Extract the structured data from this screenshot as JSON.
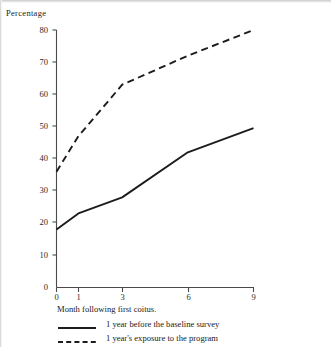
{
  "figure": {
    "y_axis_label": "Percentage",
    "x_axis_caption": "Month following first coitus."
  },
  "legend": {
    "items": [
      {
        "label": "1 year before the baseline survey",
        "style": "solid",
        "swatch_icon": "solid-line-icon"
      },
      {
        "label": "1 year's exposure to the program",
        "style": "dashed",
        "swatch_icon": "dashed-line-icon"
      }
    ]
  },
  "axes": {
    "y_ticks": [
      "80",
      "70",
      "60",
      "50",
      "40",
      "30",
      "20",
      "10",
      "0"
    ],
    "x_ticks": [
      "0",
      "1",
      "3",
      "6",
      "9"
    ]
  },
  "chart_data": {
    "type": "line",
    "title": "",
    "xlabel": "Month following first coitus.",
    "ylabel": "Percentage",
    "x": [
      0,
      1,
      3,
      6,
      9
    ],
    "xlim": [
      0,
      9
    ],
    "ylim": [
      0,
      80
    ],
    "y_ticks": [
      0,
      10,
      20,
      30,
      40,
      50,
      60,
      70,
      80
    ],
    "x_ticks": [
      0,
      1,
      3,
      6,
      9
    ],
    "grid": false,
    "legend_position": "below-axis",
    "series": [
      {
        "name": "1 year before the baseline survey",
        "style": "solid",
        "values": [
          18,
          23,
          28,
          42,
          49.5
        ]
      },
      {
        "name": "1 year's exposure to the program",
        "style": "dashed",
        "values": [
          36,
          47,
          63,
          72,
          80
        ]
      }
    ]
  }
}
